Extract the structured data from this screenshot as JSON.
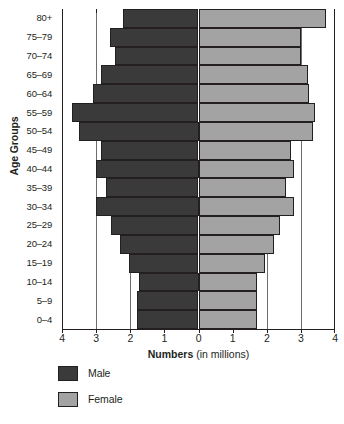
{
  "chart_data": {
    "type": "bar",
    "subtype": "population-pyramid",
    "title": "",
    "xlabel_bold": "Numbers",
    "xlabel_rest": " (in millions)",
    "ylabel": "Age Groups",
    "categories": [
      "80+",
      "75–79",
      "70–74",
      "65–69",
      "60–64",
      "55–59",
      "50–54",
      "45–49",
      "40–44",
      "35–39",
      "30–34",
      "25–29",
      "20–24",
      "15–19",
      "10–14",
      "5–9",
      "0–4"
    ],
    "series": [
      {
        "name": "Male",
        "color": "#3a3a3a",
        "side": "left",
        "values": [
          2.2,
          2.6,
          2.45,
          2.85,
          3.1,
          3.7,
          3.5,
          2.85,
          3.0,
          2.7,
          3.0,
          2.55,
          2.3,
          2.05,
          1.75,
          1.8,
          1.8
        ]
      },
      {
        "name": "Female",
        "color": "#a3a3a3",
        "side": "right",
        "values": [
          3.75,
          3.0,
          3.0,
          3.2,
          3.25,
          3.4,
          3.35,
          2.7,
          2.8,
          2.55,
          2.8,
          2.4,
          2.2,
          1.95,
          1.7,
          1.7,
          1.7
        ]
      }
    ],
    "x_ticks": [
      -4,
      -3,
      -2,
      -1,
      0,
      1,
      2,
      3,
      4
    ],
    "x_tick_labels": [
      "4",
      "3",
      "2",
      "1",
      "0",
      "1",
      "2",
      "3",
      "4"
    ],
    "xlim": [
      -4,
      4
    ],
    "gridlines_at": [
      -3,
      -2,
      -1,
      1,
      2,
      3
    ],
    "grid": true,
    "legend_position": "bottom-left",
    "legend": [
      {
        "label": "Male",
        "color": "#3a3a3a",
        "swatch": "male-swatch"
      },
      {
        "label": "Female",
        "color": "#a3a3a3",
        "swatch": "female-swatch"
      }
    ]
  }
}
